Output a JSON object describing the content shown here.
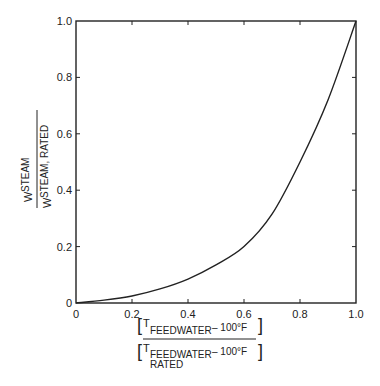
{
  "chart_data": {
    "type": "line",
    "title": "",
    "xlabel": {
      "numerator": {
        "main": "T",
        "sub": "FEEDWATER",
        "rest": "–  100°F"
      },
      "denominator": {
        "main": "T",
        "sub": "FEEDWATER",
        "sub2": "RATED",
        "rest": "–  100°F"
      }
    },
    "ylabel": {
      "numerator": {
        "main": "W",
        "sub": "STEAM"
      },
      "denominator": {
        "main": "W",
        "sub": "STEAM, RATED"
      }
    },
    "xlim": [
      0,
      1.0
    ],
    "ylim": [
      0,
      1.0
    ],
    "grid": false,
    "x_ticks": [
      0,
      0.2,
      0.4,
      0.6,
      0.8,
      1.0
    ],
    "x_tick_labels": [
      "0",
      "0.2",
      "0.4",
      "0.6",
      "0.8",
      "1.0"
    ],
    "y_ticks": [
      0,
      0.2,
      0.4,
      0.6,
      0.8,
      1.0
    ],
    "y_tick_labels": [
      "0",
      "0.2",
      "0.4",
      "0.6",
      "0.8",
      "1.0"
    ],
    "series": [
      {
        "name": "steam flow ratio",
        "x": [
          0,
          0.1,
          0.2,
          0.3,
          0.4,
          0.5,
          0.6,
          0.7,
          0.8,
          0.9,
          1.0
        ],
        "y": [
          0,
          0.01,
          0.025,
          0.05,
          0.085,
          0.135,
          0.2,
          0.315,
          0.5,
          0.72,
          1.0
        ]
      }
    ],
    "line_color": "#222222"
  }
}
